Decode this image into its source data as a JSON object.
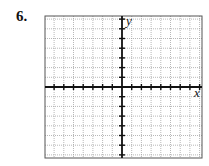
{
  "problem": {
    "number": "6."
  },
  "graph": {
    "x_label": "x",
    "y_label": "y",
    "columns": 16,
    "rows": 15,
    "colors": {
      "grid": "#9a9a9a",
      "axis": "#111111",
      "frame": "#555555"
    }
  }
}
